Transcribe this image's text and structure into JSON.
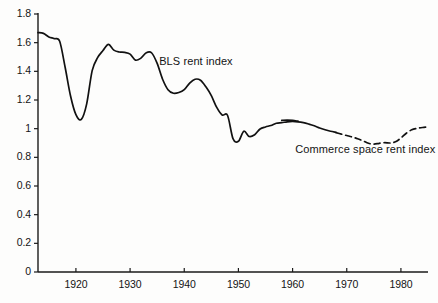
{
  "chart_data": {
    "type": "line",
    "title": "",
    "xlabel": "",
    "ylabel": "",
    "xlim": [
      1913,
      1985
    ],
    "ylim": [
      0,
      1.8
    ],
    "grid": false,
    "legend_position": "inline-annotations",
    "y_ticks": [
      "0",
      "0.2",
      "0.4",
      "0.6",
      "0.8",
      "1",
      "1.2",
      "1.4",
      "1.6",
      "1.8"
    ],
    "y_tick_values": [
      0,
      0.2,
      0.4,
      0.6,
      0.8,
      1.0,
      1.2,
      1.4,
      1.6,
      1.8
    ],
    "x_ticks": [
      "1920",
      "1930",
      "1940",
      "1950",
      "1960",
      "1970",
      "1980"
    ],
    "x_tick_values": [
      1920,
      1930,
      1940,
      1950,
      1960,
      1970,
      1980
    ],
    "annotations": [
      {
        "text": "BLS rent index",
        "x": 1935,
        "y": 1.455
      },
      {
        "text": "Commerce space rent index",
        "x": 1969,
        "y": 0.845
      }
    ],
    "series": [
      {
        "name": "BLS rent index",
        "style": "solid",
        "color": "#111111",
        "points": [
          [
            1913,
            1.67
          ],
          [
            1914,
            1.665
          ],
          [
            1915,
            1.64
          ],
          [
            1916,
            1.628
          ],
          [
            1917,
            1.61
          ],
          [
            1918,
            1.43
          ],
          [
            1919,
            1.23
          ],
          [
            1920,
            1.098
          ],
          [
            1921,
            1.065
          ],
          [
            1922,
            1.175
          ],
          [
            1923,
            1.405
          ],
          [
            1924,
            1.495
          ],
          [
            1925,
            1.545
          ],
          [
            1926,
            1.588
          ],
          [
            1927,
            1.548
          ],
          [
            1928,
            1.535
          ],
          [
            1929,
            1.532
          ],
          [
            1930,
            1.52
          ],
          [
            1931,
            1.478
          ],
          [
            1932,
            1.492
          ],
          [
            1933,
            1.53
          ],
          [
            1934,
            1.528
          ],
          [
            1935,
            1.455
          ],
          [
            1936,
            1.345
          ],
          [
            1937,
            1.272
          ],
          [
            1938,
            1.247
          ],
          [
            1939,
            1.252
          ],
          [
            1940,
            1.272
          ],
          [
            1941,
            1.318
          ],
          [
            1942,
            1.345
          ],
          [
            1943,
            1.338
          ],
          [
            1944,
            1.292
          ],
          [
            1945,
            1.23
          ],
          [
            1946,
            1.148
          ],
          [
            1947,
            1.095
          ],
          [
            1948,
            1.092
          ],
          [
            1949,
            0.93
          ],
          [
            1950,
            0.912
          ],
          [
            1951,
            0.982
          ],
          [
            1952,
            0.945
          ],
          [
            1953,
            0.958
          ],
          [
            1954,
            0.998
          ],
          [
            1955,
            1.012
          ],
          [
            1956,
            1.022
          ],
          [
            1957,
            1.038
          ],
          [
            1958,
            1.042
          ],
          [
            1959,
            1.048
          ],
          [
            1960,
            1.05
          ],
          [
            1961,
            1.048
          ],
          [
            1962,
            1.042
          ],
          [
            1963,
            1.032
          ],
          [
            1964,
            1.02
          ],
          [
            1965,
            1.005
          ],
          [
            1966,
            0.992
          ],
          [
            1967,
            0.982
          ],
          [
            1968,
            0.975
          ]
        ]
      },
      {
        "name": "BLS rent index overlap segment",
        "style": "solid",
        "color": "#111111",
        "points": [
          [
            1958,
            1.058
          ],
          [
            1959,
            1.06
          ],
          [
            1960,
            1.058
          ],
          [
            1961,
            1.052
          ]
        ]
      },
      {
        "name": "Commerce space rent index",
        "style": "dashed",
        "color": "#111111",
        "points": [
          [
            1968,
            0.972
          ],
          [
            1969,
            0.962
          ],
          [
            1970,
            0.952
          ],
          [
            1971,
            0.942
          ],
          [
            1972,
            0.93
          ],
          [
            1973,
            0.915
          ],
          [
            1974,
            0.898
          ],
          [
            1975,
            0.892
          ],
          [
            1976,
            0.898
          ],
          [
            1977,
            0.902
          ],
          [
            1978,
            0.9
          ],
          [
            1979,
            0.908
          ],
          [
            1980,
            0.935
          ],
          [
            1981,
            0.968
          ],
          [
            1982,
            0.992
          ],
          [
            1983,
            1.002
          ],
          [
            1984,
            1.008
          ],
          [
            1985,
            1.012
          ]
        ]
      }
    ]
  },
  "axes": {
    "y_labels": [
      {
        "text": "1.8",
        "value": 1.8
      },
      {
        "text": "1.6",
        "value": 1.6
      },
      {
        "text": "1.4",
        "value": 1.4
      },
      {
        "text": "1.2",
        "value": 1.2
      },
      {
        "text": "1",
        "value": 1.0
      },
      {
        "text": "0.8",
        "value": 0.8
      },
      {
        "text": "0.6",
        "value": 0.6
      },
      {
        "text": "0.4",
        "value": 0.4
      },
      {
        "text": "0.2",
        "value": 0.2
      },
      {
        "text": "0",
        "value": 0
      }
    ],
    "x_labels": [
      {
        "text": "1920",
        "value": 1920
      },
      {
        "text": "1930",
        "value": 1930
      },
      {
        "text": "1940",
        "value": 1940
      },
      {
        "text": "1950",
        "value": 1950
      },
      {
        "text": "1960",
        "value": 1960
      },
      {
        "text": "1970",
        "value": 1970
      },
      {
        "text": "1980",
        "value": 1980
      }
    ],
    "axis_color": "#1a1a1a"
  },
  "labels": {
    "bls": "BLS rent index",
    "commerce": "Commerce space rent index"
  }
}
